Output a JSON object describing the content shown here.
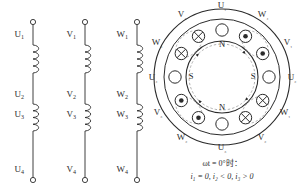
{
  "figure": {
    "title_caption_line1": "ωt = 0°时：",
    "title_caption_line2": "i₁ = 0, i₂ < 0, i₃ > 0",
    "stroke_color": "#2b2b2b",
    "dash_color": "#9a9a9a",
    "background": "#ffffff"
  },
  "winding_diagram": {
    "name": "three-phase-winding-coils",
    "phases": [
      {
        "id": "U",
        "x": 33,
        "terminals": [
          "U₁",
          "U₂",
          "U₃",
          "U₄"
        ],
        "labels": [
          {
            "text": "U",
            "sub": "1",
            "y": 37
          },
          {
            "text": "U",
            "sub": "2",
            "y": 97
          },
          {
            "text": "U",
            "sub": "3",
            "y": 117
          },
          {
            "text": "U",
            "sub": "4",
            "y": 172
          }
        ]
      },
      {
        "id": "V",
        "x": 85,
        "terminals": [
          "V₁",
          "V₂",
          "V₃",
          "V₄"
        ],
        "labels": [
          {
            "text": "V",
            "sub": "1",
            "y": 37
          },
          {
            "text": "V",
            "sub": "2",
            "y": 97
          },
          {
            "text": "V",
            "sub": "3",
            "y": 117
          },
          {
            "text": "V",
            "sub": "4",
            "y": 172
          }
        ]
      },
      {
        "id": "W",
        "x": 137,
        "terminals": [
          "W₁",
          "W₂",
          "W₃",
          "W₄"
        ],
        "labels": [
          {
            "text": "W",
            "sub": "1",
            "y": 37
          },
          {
            "text": "W",
            "sub": "2",
            "y": 97
          },
          {
            "text": "W",
            "sub": "3",
            "y": 117
          },
          {
            "text": "W",
            "sub": "4",
            "y": 172
          }
        ]
      }
    ]
  },
  "stator_diagram": {
    "name": "stator-cross-section",
    "center_x": 222,
    "center_y": 77,
    "radius_outer": 68,
    "radius_mid": 58,
    "radius_inner": 36,
    "pole_labels": [
      {
        "text": "N",
        "x": 222,
        "y": 47
      },
      {
        "text": "N",
        "x": 222,
        "y": 110
      },
      {
        "text": "S",
        "x": 191,
        "y": 79
      },
      {
        "text": "S",
        "x": 253,
        "y": 79
      }
    ],
    "slots": [
      {
        "index": 0,
        "label": "U₁",
        "angle": -90,
        "current": "zero",
        "label_x": 222,
        "label_y": 8
      },
      {
        "index": 1,
        "label": "W₄",
        "angle": -60,
        "current": "out",
        "label_x": 263,
        "label_y": 17
      },
      {
        "index": 2,
        "label": "V₁",
        "angle": -30,
        "current": "out",
        "label_x": 288,
        "label_y": 45
      },
      {
        "index": 3,
        "label": "U₂",
        "angle": 0,
        "current": "zero",
        "label_x": 292,
        "label_y": 80
      },
      {
        "index": 4,
        "label": "W₁",
        "angle": 30,
        "current": "in",
        "label_x": 285,
        "label_y": 115
      },
      {
        "index": 5,
        "label": "V₂",
        "angle": 60,
        "current": "in",
        "label_x": 262,
        "label_y": 140
      },
      {
        "index": 6,
        "label": "U₃",
        "angle": 90,
        "current": "zero",
        "label_x": 222,
        "label_y": 150
      },
      {
        "index": 7,
        "label": "W₂",
        "angle": 120,
        "current": "out",
        "label_x": 182,
        "label_y": 140
      },
      {
        "index": 8,
        "label": "V₃",
        "angle": 150,
        "current": "out",
        "label_x": 158,
        "label_y": 115
      },
      {
        "index": 9,
        "label": "U₄",
        "angle": 180,
        "current": "zero",
        "label_x": 153,
        "label_y": 80
      },
      {
        "index": 10,
        "label": "W₃",
        "angle": 210,
        "current": "in",
        "label_x": 157,
        "label_y": 45
      },
      {
        "index": 11,
        "label": "V₄",
        "angle": 240,
        "current": "in",
        "label_x": 182,
        "label_y": 17
      }
    ],
    "legend": {
      "out_symbol": "⊙",
      "in_symbol": "⊗",
      "zero_symbol": "○"
    }
  }
}
